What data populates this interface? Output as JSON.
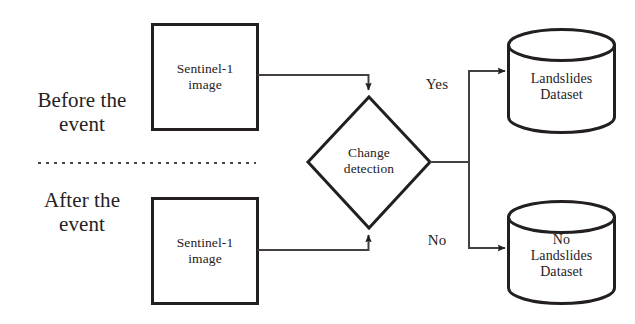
{
  "diagram": {
    "background_color": "#ffffff",
    "stroke_color": "#231f20",
    "text_color": "#262223",
    "stages": {
      "before": "Before the\nevent",
      "after": "After the\nevent"
    },
    "inputs": {
      "before_image": "Sentinel-1\nimage",
      "after_image": "Sentinel-1\nimage"
    },
    "decision": {
      "label": "Change\ndetection"
    },
    "branches": {
      "yes": "Yes",
      "no": "No"
    },
    "datastores": {
      "landslides": "Landslides\nDataset",
      "no_landslides": "No\nLandslides\nDataset"
    },
    "separator": {
      "style": "dotted"
    }
  }
}
